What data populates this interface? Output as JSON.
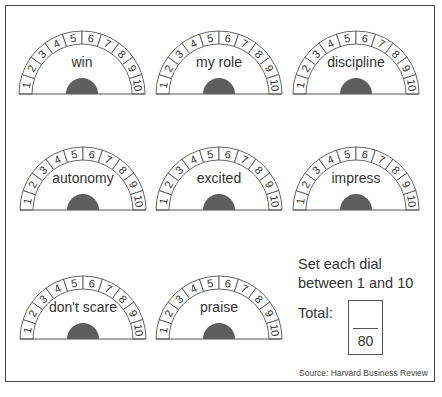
{
  "dials": [
    {
      "label": "win",
      "cx": 82,
      "cy": 94
    },
    {
      "label": "my role",
      "cx": 219,
      "cy": 94
    },
    {
      "label": "discipline",
      "cx": 356,
      "cy": 94
    },
    {
      "label": "autonomy",
      "cx": 83,
      "cy": 210
    },
    {
      "label": "excited",
      "cx": 219,
      "cy": 210
    },
    {
      "label": "impress",
      "cx": 356,
      "cy": 210
    },
    {
      "label": "don't scare",
      "cx": 83,
      "cy": 339
    },
    {
      "label": "praise",
      "cx": 219,
      "cy": 339
    }
  ],
  "dial_scale": [
    "1",
    "2",
    "3",
    "4",
    "5",
    "6",
    "7",
    "8",
    "9",
    "10"
  ],
  "dial_geometry": {
    "outer_radius": 63,
    "inner_radius": 50,
    "knob_radius": 16
  },
  "colors": {
    "knob": "#5e5e5e",
    "stroke": "#555555",
    "text": "#333333"
  },
  "instructions": "Set each dial between 1 and 10",
  "total": {
    "label": "Total:",
    "value": "",
    "denominator": "80"
  },
  "source": "Source: Harvard Business Review"
}
